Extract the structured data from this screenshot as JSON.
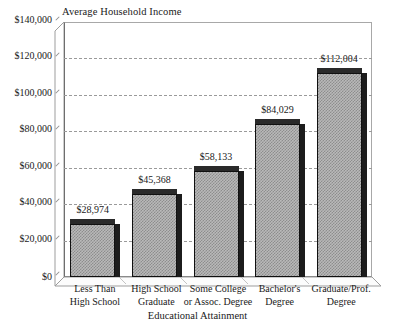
{
  "chart_data": {
    "type": "bar",
    "title": "",
    "ylabel": "Average Household Income",
    "xlabel": "Educational Attainment",
    "categories": [
      "Less Than\nHigh School",
      "High School\nGraduate",
      "Some College\nor Assoc. Degree",
      "Bachelor's\nDegree",
      "Graduate/Prof.\nDegree"
    ],
    "values": [
      28974,
      45368,
      58133,
      84029,
      112004
    ],
    "value_labels": [
      "$28,974",
      "$45,368",
      "$58,133",
      "$84,029",
      "$112,004"
    ],
    "ylim": [
      0,
      140000
    ],
    "ytick_values": [
      0,
      20000,
      40000,
      60000,
      80000,
      100000,
      120000,
      140000
    ],
    "ytick_labels": [
      "$0",
      "$20,000",
      "$40,000",
      "$60,000",
      "$80,000",
      "$100,000",
      "$120,000",
      "$140,000"
    ],
    "grid": true,
    "legend": false,
    "style": {
      "bar_fill": "#b9b9b9",
      "bar_pattern": "checker-dither",
      "bar_border": "#101010",
      "bar_shadow": "#1c1c1c",
      "gridline_color": "#9a9a9a",
      "gridline_style": "dashed",
      "axis_color": "#6e6e6e",
      "background": "#ffffff",
      "three_d": true
    }
  }
}
